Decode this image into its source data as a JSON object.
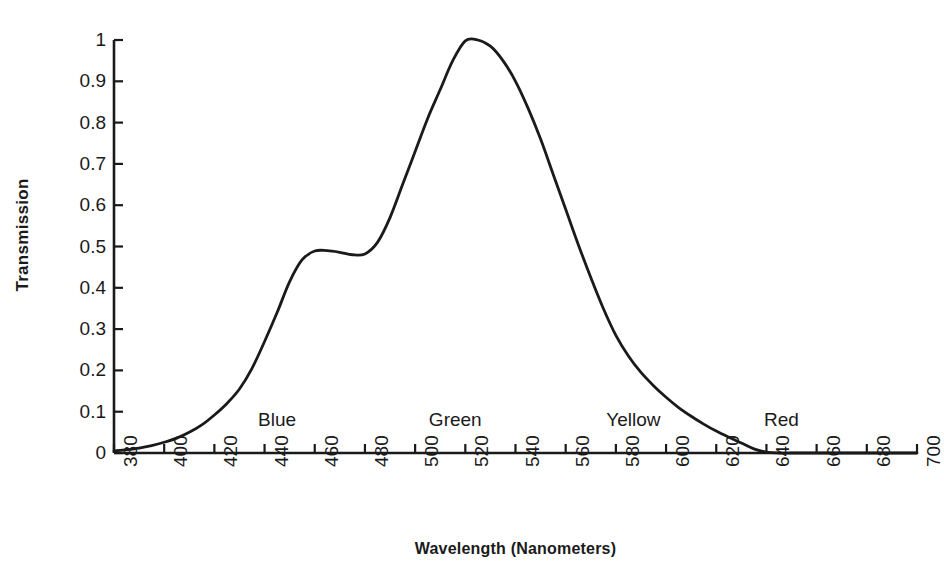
{
  "chart_data": {
    "type": "line",
    "title": "",
    "xlabel": "Wavelength  (Nanometers)",
    "ylabel": "Transmission",
    "xlim": [
      380,
      700
    ],
    "ylim": [
      0,
      1
    ],
    "grid": false,
    "legend": null,
    "x_tick_labels": [
      "380",
      "400",
      "420",
      "440",
      "460",
      "480",
      "500",
      "520",
      "540",
      "560",
      "580",
      "600",
      "620",
      "640",
      "660",
      "680",
      "700"
    ],
    "x_ticks": [
      380,
      400,
      420,
      440,
      460,
      480,
      500,
      520,
      540,
      560,
      580,
      600,
      620,
      640,
      660,
      680,
      700
    ],
    "y_tick_labels": [
      "0",
      "0.1",
      "0.2",
      "0.3",
      "0.4",
      "0.5",
      "0.6",
      "0.7",
      "0.8",
      "0.9",
      "1"
    ],
    "y_ticks": [
      0,
      0.1,
      0.2,
      0.3,
      0.4,
      0.5,
      0.6,
      0.7,
      0.8,
      0.9,
      1
    ],
    "series": [
      {
        "name": "Transmission",
        "color": "#1a1a1a",
        "x": [
          380,
          385,
          390,
          395,
          400,
          405,
          410,
          415,
          420,
          425,
          430,
          435,
          440,
          445,
          450,
          455,
          460,
          465,
          470,
          475,
          480,
          485,
          490,
          495,
          500,
          505,
          510,
          515,
          520,
          525,
          530,
          535,
          540,
          545,
          550,
          555,
          560,
          565,
          570,
          575,
          580,
          585,
          590,
          595,
          600,
          605,
          610,
          615,
          620,
          625,
          630,
          635,
          640,
          645,
          650,
          660,
          670,
          680,
          690,
          700
        ],
        "y": [
          0.005,
          0.008,
          0.012,
          0.018,
          0.026,
          0.036,
          0.05,
          0.068,
          0.092,
          0.12,
          0.155,
          0.205,
          0.27,
          0.34,
          0.415,
          0.468,
          0.489,
          0.49,
          0.486,
          0.48,
          0.482,
          0.51,
          0.57,
          0.65,
          0.73,
          0.81,
          0.88,
          0.95,
          0.998,
          1.0,
          0.985,
          0.95,
          0.9,
          0.835,
          0.76,
          0.675,
          0.59,
          0.505,
          0.425,
          0.35,
          0.285,
          0.235,
          0.195,
          0.163,
          0.135,
          0.11,
          0.089,
          0.07,
          0.053,
          0.038,
          0.024,
          0.01,
          0.002,
          0.0,
          0.0,
          0.0,
          0.0,
          0.0,
          0.0,
          0.0
        ]
      }
    ],
    "annotations": [
      {
        "label": "Blue",
        "x": 445,
        "y": 0.075
      },
      {
        "label": "Green",
        "x": 516,
        "y": 0.075
      },
      {
        "label": "Yellow",
        "x": 587,
        "y": 0.075
      },
      {
        "label": "Red",
        "x": 646,
        "y": 0.075
      }
    ]
  },
  "axes": {
    "ylabel": "Transmission",
    "xlabel": "Wavelength  (Nanometers)"
  }
}
